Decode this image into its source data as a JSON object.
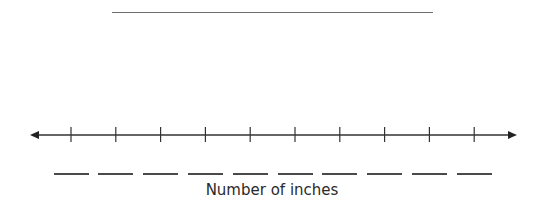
{
  "title_blank": "",
  "number_line": {
    "ticks": 10,
    "tick_labels": [
      "",
      "",
      "",
      "",
      "",
      "",
      "",
      "",
      "",
      ""
    ],
    "arrows": "both",
    "color": "#333333"
  },
  "axis_label": "Number of inches"
}
